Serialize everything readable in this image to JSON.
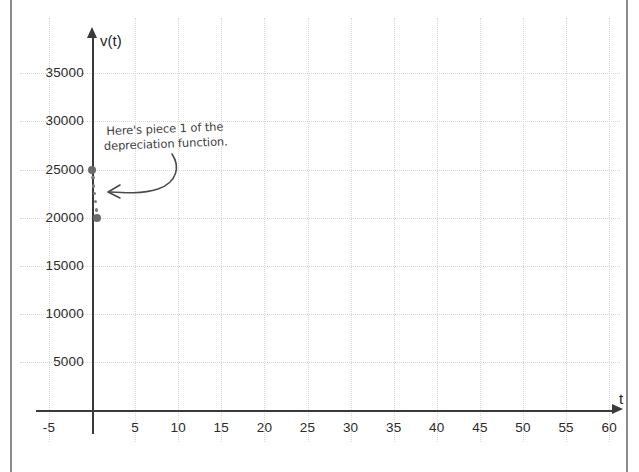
{
  "chart_data": {
    "type": "scatter",
    "title": "",
    "subtitle": "",
    "xlabel": "t",
    "ylabel": "v(t)",
    "xlim": [
      -7,
      63
    ],
    "ylim": [
      0,
      37000
    ],
    "grid": true,
    "legend": null,
    "x_ticks": [
      -5,
      5,
      10,
      15,
      20,
      25,
      30,
      35,
      40,
      45,
      50,
      55,
      60
    ],
    "x_tick_labels": [
      "-5",
      "5",
      "10",
      "15",
      "20",
      "25",
      "30",
      "35",
      "40",
      "45",
      "50",
      "55",
      "60"
    ],
    "y_ticks": [
      5000,
      10000,
      15000,
      20000,
      25000,
      30000,
      35000
    ],
    "y_tick_labels": [
      "5000",
      "10000",
      "15000",
      "20000",
      "25000",
      "30000",
      "35000"
    ],
    "series": [
      {
        "name": "piece 1 of the depreciation function",
        "style": "dotted-segment",
        "endpoints": [
          {
            "x": 0,
            "y": 25000,
            "marker": "filled-large"
          },
          {
            "x": 0.6,
            "y": 20000,
            "marker": "filled-large"
          }
        ],
        "values": [
          {
            "x": 0.0,
            "y": 25000
          },
          {
            "x": 0.1,
            "y": 24200
          },
          {
            "x": 0.2,
            "y": 23300
          },
          {
            "x": 0.3,
            "y": 22500
          },
          {
            "x": 0.4,
            "y": 21700
          },
          {
            "x": 0.5,
            "y": 20800
          },
          {
            "x": 0.6,
            "y": 20000
          }
        ]
      }
    ],
    "annotations": [
      {
        "text_lines": [
          "Here's piece 1 of the",
          "depreciation function."
        ],
        "points_to": {
          "x": 0.6,
          "y": 21500
        },
        "arrow": "curved-left"
      }
    ]
  },
  "axes": {
    "y_name": "v(t)",
    "x_name": "t"
  },
  "annotation": {
    "line1": "Here's piece 1 of the",
    "line2": "depreciation function."
  },
  "colors": {
    "axis": "#3a3a3a",
    "grid": "#d7d7d7",
    "marker": "#6a6a6a",
    "annotation": "#3d3d3d",
    "page_edge": "#8c8c8c",
    "background": "#ffffff"
  }
}
